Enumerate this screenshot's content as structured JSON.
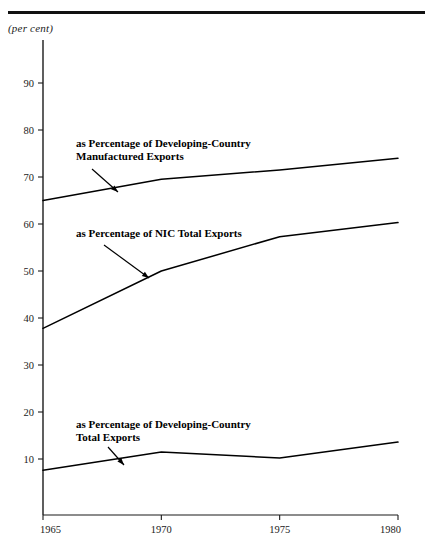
{
  "figure": {
    "unit_label": "(per cent)",
    "rule_color": "#111111"
  },
  "chart_data": {
    "type": "line",
    "title": "",
    "subtitle": "",
    "xlabel": "",
    "ylabel": "(per cent)",
    "x": [
      1965,
      1970,
      1975,
      1980
    ],
    "xticklabels": [
      "1965",
      "1970",
      "1975",
      "1980"
    ],
    "xlim": [
      1965,
      1980
    ],
    "ylim": [
      0,
      99.5
    ],
    "yticks": [
      10,
      20,
      30,
      40,
      50,
      60,
      70,
      80,
      90
    ],
    "yticklabels": [
      "10",
      "20",
      "30",
      "40",
      "50",
      "60",
      "70",
      "80",
      "90"
    ],
    "grid": false,
    "legend_position": "inline-annotations",
    "line_color": "#000000",
    "series": [
      {
        "name": "as Percentage of Developing-Country Manufactured Exports",
        "values": [
          65.0,
          69.5,
          71.5,
          74.0
        ]
      },
      {
        "name": "as Percentage of NIC Total Exports",
        "values": [
          37.8,
          50.0,
          57.3,
          60.3
        ]
      },
      {
        "name": "as Percentage of Developing-Country Total Exports",
        "values": [
          7.6,
          11.5,
          10.2,
          13.6
        ]
      }
    ],
    "annotations": [
      {
        "id": "annot-manufactured-exports",
        "lines": [
          "as Percentage of Developing-Country",
          "Manufactured Exports"
        ],
        "text_x": 76,
        "text_y": 147,
        "leader_from_x": 92,
        "leader_from_y": 169,
        "leader_to_x": 118,
        "leader_to_y": 192
      },
      {
        "id": "annot-nic-total-exports",
        "lines": [
          "as Percentage of NIC Total Exports"
        ],
        "text_x": 76,
        "text_y": 237,
        "leader_from_x": 104,
        "leader_from_y": 245,
        "leader_to_x": 149,
        "leader_to_y": 278
      },
      {
        "id": "annot-developing-total-exports",
        "lines": [
          "as Percentage of Developing-Country",
          "Total Exports"
        ],
        "text_x": 76,
        "text_y": 428,
        "leader_from_x": 108,
        "leader_from_y": 447,
        "leader_to_x": 124,
        "leader_to_y": 465
      }
    ]
  }
}
